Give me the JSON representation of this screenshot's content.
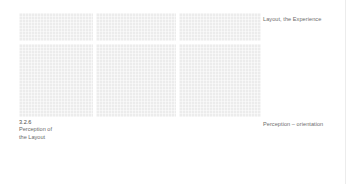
{
  "figure": {
    "panels": [
      {
        "row": 1,
        "col": 1
      },
      {
        "row": 1,
        "col": 2
      },
      {
        "row": 1,
        "col": 3
      },
      {
        "row": 2,
        "col": 1
      },
      {
        "row": 2,
        "col": 2
      },
      {
        "row": 2,
        "col": 3
      }
    ],
    "caption_top": "Layout, the Experience",
    "caption_bottom": "Perception – orientation"
  },
  "section": {
    "number": "3.2.6",
    "title_line1": "Perception of",
    "title_line2": "the Layout"
  }
}
